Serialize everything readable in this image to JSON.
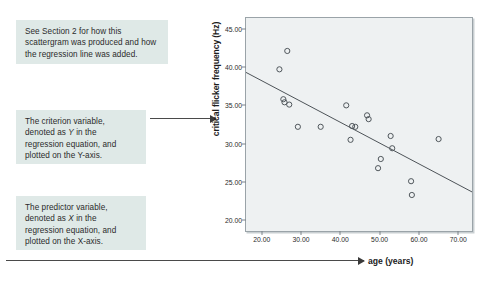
{
  "callouts": [
    {
      "id": "callout-1",
      "lines": [
        "See Section 2 for how this",
        "scattergram was produced and how",
        "the regression line was added."
      ]
    },
    {
      "id": "callout-2",
      "lines": [
        "The criterion variable,",
        "denoted as Y in the",
        "regression equation, and",
        "plotted on the Y-axis."
      ]
    },
    {
      "id": "callout-3",
      "lines": [
        "The predictor variable,",
        "denoted as X in the",
        "regression equation, and",
        "plotted on the X-axis."
      ]
    }
  ],
  "chart_data": {
    "type": "scatter",
    "title": "",
    "xlabel": "age (years)",
    "ylabel": "critical flicker frequency (Hz)",
    "xlim": [
      16,
      73.5
    ],
    "ylim": [
      18.6,
      46.4
    ],
    "xticks": [
      "20.00",
      "30.00",
      "40.00",
      "50.00",
      "60.00",
      "70.00"
    ],
    "xtick_values": [
      20,
      30,
      40,
      50,
      60,
      70
    ],
    "yticks": [
      "20.00",
      "25.00",
      "30.00",
      "35.00",
      "40.00",
      "45.00"
    ],
    "ytick_values": [
      20,
      25,
      30,
      35,
      40,
      45
    ],
    "grid": false,
    "legend": "none",
    "marker": "open-circle",
    "points": [
      {
        "x": 26.5,
        "y": 42.1
      },
      {
        "x": 24.5,
        "y": 39.7
      },
      {
        "x": 25.5,
        "y": 35.8
      },
      {
        "x": 25.8,
        "y": 35.4
      },
      {
        "x": 27.0,
        "y": 35.1
      },
      {
        "x": 29.2,
        "y": 32.2
      },
      {
        "x": 35.0,
        "y": 32.2
      },
      {
        "x": 41.5,
        "y": 35.0
      },
      {
        "x": 43.0,
        "y": 32.3
      },
      {
        "x": 43.8,
        "y": 32.2
      },
      {
        "x": 42.6,
        "y": 30.5
      },
      {
        "x": 46.8,
        "y": 33.7
      },
      {
        "x": 47.2,
        "y": 33.2
      },
      {
        "x": 50.3,
        "y": 28.0
      },
      {
        "x": 49.6,
        "y": 26.8
      },
      {
        "x": 52.8,
        "y": 31.0
      },
      {
        "x": 53.2,
        "y": 29.4
      },
      {
        "x": 58.0,
        "y": 25.1
      },
      {
        "x": 58.2,
        "y": 23.3
      },
      {
        "x": 65.0,
        "y": 30.6
      }
    ],
    "regression_line": {
      "x1": 16.0,
      "y1": 39.3,
      "x2": 73.5,
      "y2": 23.7,
      "description": "fitted regression line"
    }
  }
}
